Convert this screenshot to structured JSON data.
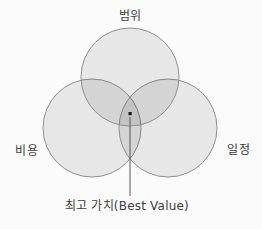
{
  "diagram": {
    "type": "venn",
    "title_hidden": "",
    "colors": {
      "background": "#fbfbfb",
      "circle_fill": "rgba(0,0,0,0.08)",
      "circle_stroke": "#8f8f8f",
      "text": "#3d3d3d",
      "leader_line": "#555555",
      "dot": "#1a1a1a"
    },
    "circles": [
      {
        "id": "scope",
        "label": "범위"
      },
      {
        "id": "cost",
        "label": "비용"
      },
      {
        "id": "schedule",
        "label": "일정"
      }
    ],
    "center_annotation": {
      "label": "최고 가치(Best Value)",
      "points_to": "triple-overlap-center"
    }
  }
}
